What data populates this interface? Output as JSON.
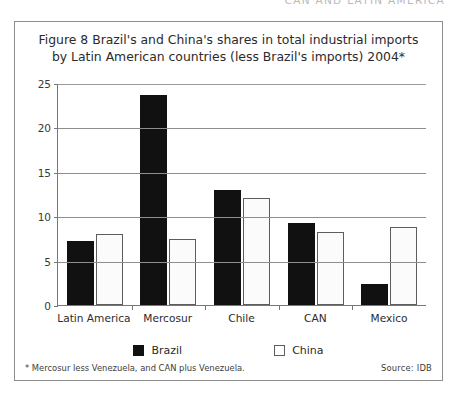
{
  "page": {
    "running_header": "CAN AND LATIN AMERICA"
  },
  "figure": {
    "title_line1": "Figure 8 Brazil's and China's shares in total industrial imports",
    "title_line2": "by Latin American countries (less Brazil's imports) 2004*",
    "footnote": "* Mercosur less Venezuela, and CAN plus Venezuela.",
    "source": "Source:  IDB"
  },
  "legend": {
    "items": [
      {
        "label": "Brazil",
        "color": "#111111"
      },
      {
        "label": "China",
        "color": "#ffffff"
      }
    ]
  },
  "chart_data": {
    "type": "bar",
    "title": "Figure 8 Brazil's and China's shares in total industrial imports by Latin American countries (less Brazil's imports) 2004*",
    "xlabel": "",
    "ylabel": "",
    "ylim": [
      0,
      25
    ],
    "yticks": [
      0,
      5,
      10,
      15,
      20,
      25
    ],
    "ytick_labels": [
      "0",
      "5",
      "10",
      "15",
      "20",
      "25"
    ],
    "grid": true,
    "grid_axis": "y",
    "legend_position": "bottom",
    "categories": [
      "Latin America",
      "Mercosur",
      "Chile",
      "CAN",
      "Mexico"
    ],
    "series": [
      {
        "name": "Brazil",
        "color": "#111111",
        "values": [
          7.2,
          23.6,
          13.0,
          9.2,
          2.4
        ]
      },
      {
        "name": "China",
        "color": "#ffffff",
        "values": [
          8.0,
          7.4,
          12.1,
          8.2,
          8.8
        ]
      }
    ],
    "footnote": "* Mercosur less Venezuela, and CAN plus Venezuela.",
    "source": "Source:  IDB"
  }
}
